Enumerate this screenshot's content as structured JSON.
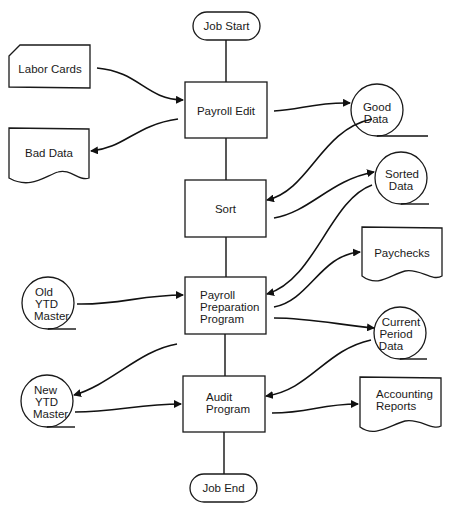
{
  "diagram": {
    "type": "system flowchart",
    "terminals": {
      "start": "Job Start",
      "end": "Job End"
    },
    "processes": [
      {
        "id": "payroll-edit",
        "lines": [
          "Payroll Edit"
        ]
      },
      {
        "id": "sort",
        "lines": [
          "Sort"
        ]
      },
      {
        "id": "payroll-prep",
        "lines": [
          "Payroll",
          "Preparation",
          "Program"
        ]
      },
      {
        "id": "audit",
        "lines": [
          "Audit",
          "Program"
        ]
      }
    ],
    "inputs": {
      "labor_cards": "Labor Cards",
      "old_ytd": [
        "Old",
        "YTD",
        "Master"
      ]
    },
    "documents": {
      "bad_data": "Bad Data",
      "paychecks": "Paychecks",
      "accounting_reports": [
        "Accounting",
        "Reports"
      ]
    },
    "tapes": {
      "good_data": [
        "Good",
        "Data"
      ],
      "sorted_data": [
        "Sorted",
        "Data"
      ],
      "current_period": [
        "Current",
        "Period",
        "Data"
      ],
      "new_ytd": [
        "New",
        "YTD",
        "Master"
      ]
    },
    "flows": [
      {
        "from": "Labor Cards",
        "to": "Payroll Edit"
      },
      {
        "from": "Payroll Edit",
        "to": "Bad Data"
      },
      {
        "from": "Payroll Edit",
        "to": "Good Data"
      },
      {
        "from": "Good Data",
        "to": "Sort"
      },
      {
        "from": "Sort",
        "to": "Sorted Data"
      },
      {
        "from": "Sorted Data",
        "to": "Payroll Preparation Program"
      },
      {
        "from": "Old YTD Master",
        "to": "Payroll Preparation Program"
      },
      {
        "from": "Payroll Preparation Program",
        "to": "Paychecks"
      },
      {
        "from": "Payroll Preparation Program",
        "to": "Current Period Data"
      },
      {
        "from": "Payroll Preparation Program",
        "to": "New YTD Master"
      },
      {
        "from": "Current Period Data",
        "to": "Audit Program"
      },
      {
        "from": "New YTD Master",
        "to": "Audit Program"
      },
      {
        "from": "Audit Program",
        "to": "Accounting Reports"
      }
    ]
  }
}
